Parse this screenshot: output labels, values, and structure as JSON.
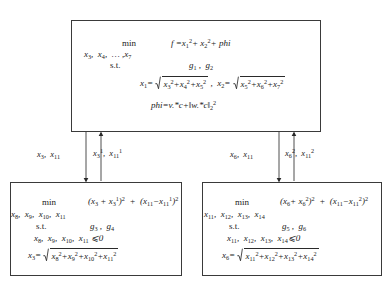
{
  "diagram": {
    "type": "bilevel-decomposition-flowchart",
    "top_box": {
      "min_label": "min",
      "variables": "x3,  x4, … , x7",
      "st_label": "s.t.",
      "constraints": "g1 ,  g2",
      "objective": "f =x1²+ x2²+ phi",
      "def_x1_lhs": "x1=",
      "def_x1_radicand": "x3²+x4²+x5²",
      "def_x2_lhs": "x2=",
      "def_x2_radicand": "x5²+x6²+x7²",
      "phi_def": "phi=v.*c+‖w.*c‖₂²"
    },
    "left_box": {
      "min_label": "min",
      "variables": "x8,  x9,  x10,  x11",
      "st_label": "s.t.",
      "constraints": "g3 ,  g4",
      "objective": "(x3 + x3¹)²  +  (x11−x11¹)²",
      "nonneg": "x8,  x9,  x10,  x11 ⩾0",
      "def_lhs": "x3=",
      "def_radicand": "x8²+x9²+x10²+x11²"
    },
    "right_box": {
      "min_label": "min",
      "variables": "x11,  x12,  x13,  x14",
      "st_label": "s.t.",
      "constraints": "g5 ,  g6",
      "objective": "(x6+ x6²)²  +  (x11−x11²)²",
      "nonneg": "x11,  x12,  x13,  x14⩾0",
      "def_lhs": "x6=",
      "def_radicand": "x11²+x12²+x13²+x14²"
    },
    "edges": {
      "left_down_label": "x3,  x11",
      "left_up_label": "x3¹,  x11¹",
      "right_down_label": "x6,  x11",
      "right_up_label": "x6²,  x11²"
    },
    "colors": {
      "stroke": "#3a3a3a",
      "text": "#1a1a1a",
      "background": "#ffffff"
    }
  }
}
